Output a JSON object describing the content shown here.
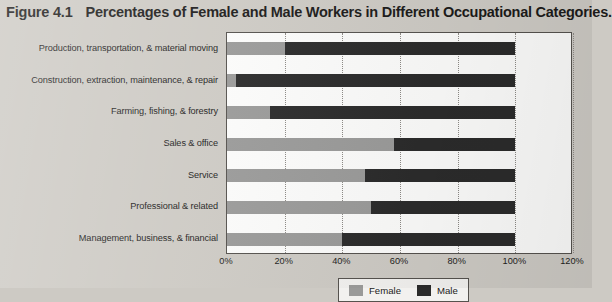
{
  "figure": {
    "label": "Figure 4.1",
    "caption": "Percentages of Female and Male Workers in Different Occupational Categories."
  },
  "legend": {
    "female_label": "Female",
    "male_label": "Male",
    "female_color": "#9a9a99",
    "male_color": "#2b2b2b"
  },
  "axis": {
    "ticks": [
      "0%",
      "20%",
      "40%",
      "60%",
      "80%",
      "100%",
      "120%"
    ]
  },
  "chart_data": {
    "type": "bar",
    "orientation": "horizontal",
    "stacked": true,
    "title": "Percentages of Female and Male Workers in Different Occupational Categories.",
    "xlabel": "",
    "ylabel": "",
    "xlim": [
      0,
      120
    ],
    "xticks": [
      0,
      20,
      40,
      60,
      80,
      100,
      120
    ],
    "xtick_labels": [
      "0%",
      "20%",
      "40%",
      "60%",
      "80%",
      "100%",
      "120%"
    ],
    "grid": true,
    "legend_position": "bottom",
    "categories": [
      "Production, transportation, & material moving",
      "Construction, extraction, maintenance, & repair",
      "Farming, fishing, & forestry",
      "Sales & office",
      "Service",
      "Professional & related",
      "Management, business, & financial"
    ],
    "series": [
      {
        "name": "Female",
        "color": "#9a9a99",
        "values": [
          20,
          3,
          15,
          58,
          48,
          50,
          40
        ]
      },
      {
        "name": "Male",
        "color": "#2b2b2b",
        "values": [
          80,
          97,
          85,
          42,
          52,
          50,
          60
        ]
      }
    ]
  }
}
